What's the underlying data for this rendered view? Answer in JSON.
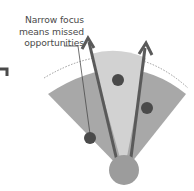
{
  "diagram": {
    "annotation": {
      "lines": [
        "Narrow focus",
        "means missed",
        "opportunities"
      ]
    },
    "colors": {
      "outer_fan": "#a8a8a8",
      "inner_fan": "#d2d2d2",
      "dots": "#4a4a4a",
      "arrows": "#5a5a5a",
      "origin_circle": "#9c9c9c",
      "dotted_arc": "#9a9a9a",
      "label_text": "#4a4a4a"
    },
    "elements": {
      "origin_circle": "origin",
      "arrows": [
        "left-focus-arrow",
        "right-focus-arrow"
      ],
      "dots": [
        "missed-opportunity-left",
        "focused-opportunity-center",
        "missed-opportunity-right"
      ],
      "partial_arrow_left_edge": "cropped-arrow"
    }
  }
}
